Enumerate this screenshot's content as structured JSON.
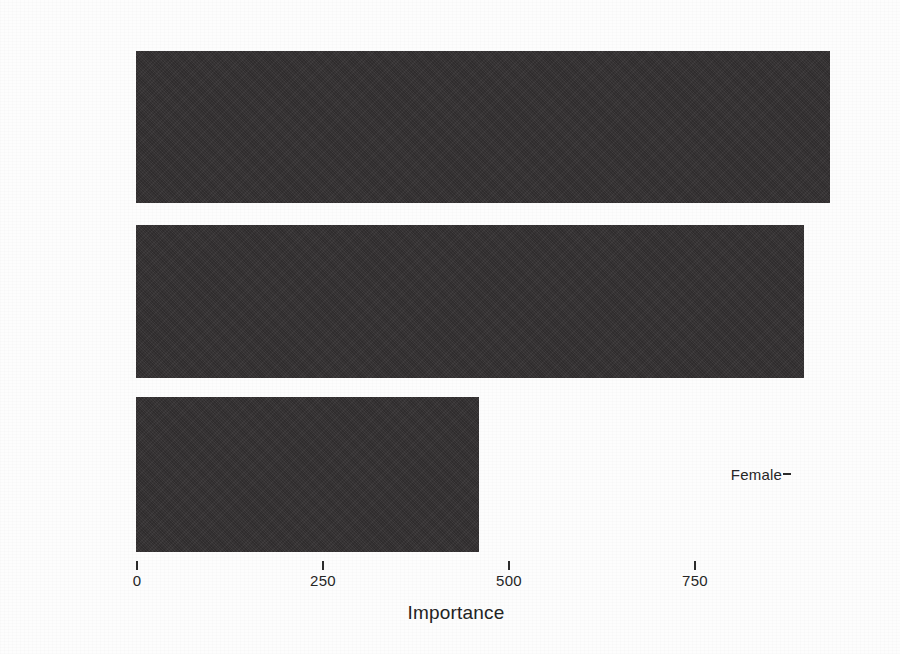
{
  "chart_data": {
    "type": "bar",
    "orientation": "horizontal",
    "title": "",
    "subtitle": "",
    "xlabel": "Importance",
    "ylabel": "",
    "categories": [
      "Educ",
      "Tenure",
      "Female"
    ],
    "values": [
      933,
      898,
      461
    ],
    "series": [
      {
        "name": "Importance",
        "values": [
          933,
          898,
          461
        ]
      }
    ],
    "xlim": [
      0,
      933
    ],
    "x_ticks": [
      0,
      250,
      500,
      750
    ],
    "x_tick_labels": [
      "0",
      "250",
      "500",
      "750"
    ],
    "y_tick_labels": [
      "Educ",
      "Tenure",
      "Female"
    ],
    "grid": false,
    "legend": false,
    "legend_position": "none",
    "bar_color": "#333031",
    "background_color": "#fdfdfd",
    "axis_text_color": "#262626"
  },
  "axis": {
    "x_title": "Importance",
    "ticks": [
      {
        "label": "0",
        "value": 0
      },
      {
        "label": "250",
        "value": 250
      },
      {
        "label": "500",
        "value": 500
      },
      {
        "label": "750",
        "value": 750
      }
    ]
  },
  "bars": [
    {
      "label": "Educ",
      "value": 933
    },
    {
      "label": "Tenure",
      "value": 898
    },
    {
      "label": "Female",
      "value": 461
    }
  ]
}
